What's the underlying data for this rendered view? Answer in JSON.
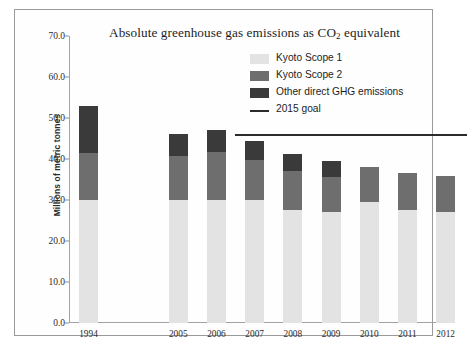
{
  "chart_data": {
    "type": "bar",
    "stacked": true,
    "title": "Absolute greenhouse gas emissions as CO2 equivalent",
    "title_prefix": "Absolute greenhouse gas emissions as CO",
    "title_sub": "2",
    "title_suffix": " equivalent",
    "xlabel": "",
    "ylabel": "Millions of metric tonnes",
    "ylim": [
      0.0,
      70.0
    ],
    "yticks": [
      "0.0",
      "10.0",
      "20.0",
      "30.0",
      "40.0",
      "50.0",
      "60.0",
      "70.0"
    ],
    "ytick_values": [
      0.0,
      10.0,
      20.0,
      30.0,
      40.0,
      50.0,
      60.0,
      70.0
    ],
    "categories": [
      "1994",
      "2005",
      "2006",
      "2007",
      "2008",
      "2009",
      "2010",
      "2011",
      "2012"
    ],
    "grid": false,
    "legend_position": "top-right",
    "series": [
      {
        "name": "Kyoto Scope 1",
        "color": "#e3e3e3",
        "values": [
          30.0,
          30.0,
          30.0,
          30.0,
          27.5,
          27.0,
          29.5,
          27.5,
          27.0
        ]
      },
      {
        "name": "Kyoto Scope 2",
        "color": "#6e6e6e",
        "values": [
          11.5,
          10.8,
          11.8,
          9.8,
          9.5,
          8.5,
          8.6,
          9.2,
          8.8
        ]
      },
      {
        "name": "Other direct GHG emissions",
        "color": "#3a3a3a",
        "values": [
          11.5,
          5.2,
          5.4,
          4.6,
          4.3,
          4.0,
          0.0,
          0.0,
          0.0
        ]
      }
    ],
    "totals": [
      53.0,
      46.0,
      47.2,
      44.4,
      41.3,
      39.5,
      38.1,
      36.7,
      35.8
    ],
    "annotations": [
      {
        "name": "2015 goal",
        "type": "hline",
        "value": 46.0,
        "x_start_category": "2007",
        "x_end_category": "2012",
        "color": "#2b2b2b"
      }
    ]
  },
  "legend": {
    "items": [
      {
        "label": "Kyoto Scope 1",
        "swatch": "sw-s1",
        "kind": "box"
      },
      {
        "label": "Kyoto Scope 2",
        "swatch": "sw-s2",
        "kind": "box"
      },
      {
        "label": "Other direct GHG emissions",
        "swatch": "sw-o",
        "kind": "box"
      },
      {
        "label": "2015 goal",
        "swatch": "sw-line",
        "kind": "line"
      }
    ]
  },
  "caption": ""
}
